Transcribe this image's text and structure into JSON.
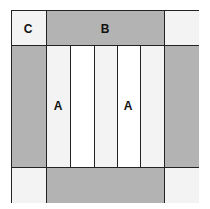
{
  "diagram": {
    "type": "quilt-block",
    "labels": {
      "corner": "C",
      "side": "B",
      "strip_left": "A",
      "strip_right": "A"
    },
    "colors": {
      "border_grey": "#b3b3b3",
      "corner_white": "#f3f3f3",
      "strip_white": "#ffffff",
      "line": "#222222"
    },
    "strips": 5
  }
}
